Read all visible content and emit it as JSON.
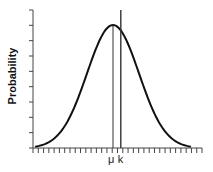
{
  "chart_data": {
    "type": "line",
    "title": "",
    "xlabel": "",
    "ylabel": "Probability",
    "curve": {
      "distribution": "normal",
      "mean_label": "μ",
      "x_range_sd": [
        -3,
        3
      ],
      "peak_relative": 0.9
    },
    "markers": [
      {
        "label": "μ",
        "position_sd": 0.0,
        "line_height": "to_peak"
      },
      {
        "label": "k",
        "position_sd": 0.3,
        "line_height": "full"
      }
    ],
    "x_ticks_count": 33,
    "y_ticks_count": 10,
    "x_tick_labels": [
      "μ",
      "k"
    ],
    "y_tick_labels": [],
    "grid": false,
    "legend": null,
    "colors": {
      "line": "#111111",
      "axis": "#444444"
    }
  },
  "labels": {
    "ylabel": "Probability",
    "mu": "μ",
    "k": "k"
  }
}
